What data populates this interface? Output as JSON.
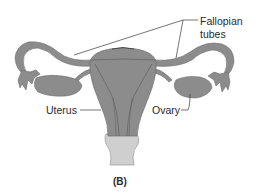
{
  "figure": {
    "caption": "(B)",
    "labels": {
      "fallopian_line1": "Fallopian",
      "fallopian_line2": "tubes",
      "uterus": "Uterus",
      "ovary": "Ovary"
    },
    "colors": {
      "organ_fill": "#8c8c8c",
      "organ_stroke": "#6e6e6e",
      "vagina_fill": "#cfcfcf",
      "leader_line": "#3a3a3a",
      "background": "#ffffff"
    }
  }
}
